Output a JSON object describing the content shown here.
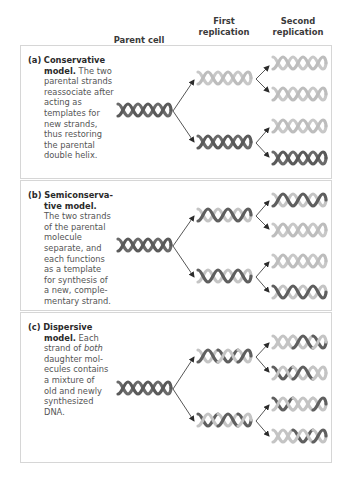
{
  "headers": {
    "parent": "Parent cell",
    "first_line1": "First",
    "first_line2": "replication",
    "second_line1": "Second",
    "second_line2": "replication"
  },
  "panels": [
    {
      "id": "a",
      "label": "(a)",
      "title_line1": "Conservative",
      "title_line2": "model.",
      "text_lines": [
        "The two",
        "parental strands",
        "reassociate after",
        "acting as",
        "templates for",
        "new strands,",
        "thus restoring",
        "the parental",
        "double helix."
      ]
    },
    {
      "id": "b",
      "label": "(b)",
      "title_line1": "Semiconserva-",
      "title_line2": "tive model.",
      "text_lines": [
        "The two strands",
        "of the parental",
        "molecule",
        "separate, and",
        "each functions",
        "as a template",
        "for synthesis of",
        "a new, comple-",
        "mentary strand."
      ]
    },
    {
      "id": "c",
      "label": "(c)",
      "title_line1": "Dispersive",
      "title_line2": "model.",
      "text_lines": [
        "Each",
        "strand of",
        "both",
        "daughter mol-",
        "ecules contains",
        "a mixture of",
        "old and newly",
        "synthesized",
        "DNA."
      ]
    }
  ],
  "colors": {
    "parental_strand": "#5f5f5f",
    "new_strand": "#c4c4c4",
    "arrow": "#2b2b2b",
    "panel_border": "#d6d6d6"
  }
}
